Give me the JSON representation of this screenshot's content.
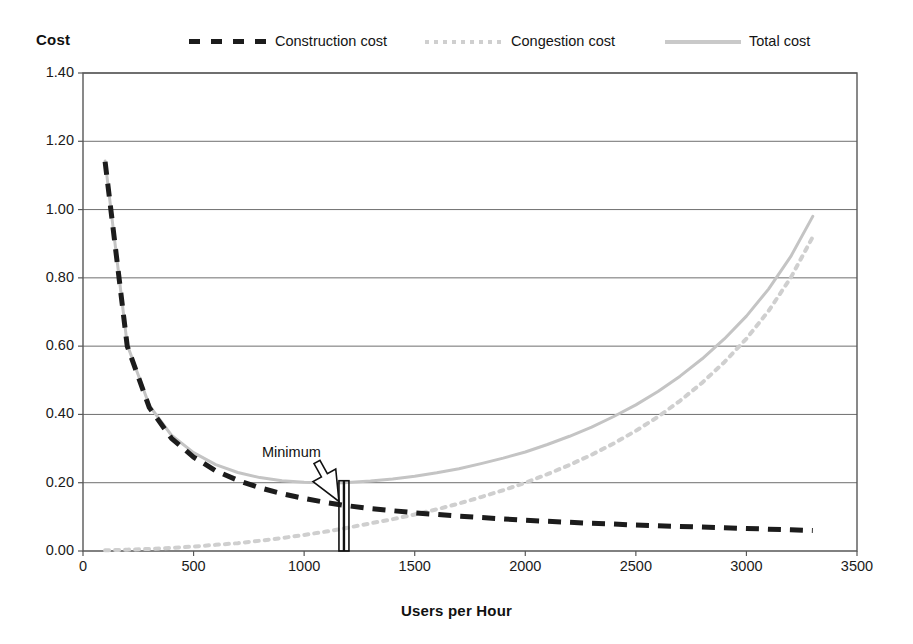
{
  "chart_data": {
    "type": "line",
    "title": "",
    "xlabel": "Users per Hour",
    "ylabel": "Cost",
    "xlim": [
      0,
      3500
    ],
    "ylim": [
      0.0,
      1.4
    ],
    "grid": "horizontal",
    "legend_position": "top",
    "x_ticks": [
      "0",
      "500",
      "1000",
      "1500",
      "2000",
      "2500",
      "3000",
      "3500"
    ],
    "x_tick_values": [
      0,
      500,
      1000,
      1500,
      2000,
      2500,
      3000,
      3500
    ],
    "y_ticks": [
      "0.00",
      "0.20",
      "0.40",
      "0.60",
      "0.80",
      "1.00",
      "1.20",
      "1.40"
    ],
    "y_tick_values": [
      0.0,
      0.2,
      0.4,
      0.6,
      0.8,
      1.0,
      1.2,
      1.4
    ],
    "x": [
      100,
      200,
      300,
      400,
      500,
      600,
      700,
      800,
      900,
      1000,
      1100,
      1180,
      1300,
      1400,
      1500,
      1600,
      1700,
      1800,
      1900,
      2000,
      2100,
      2200,
      2300,
      2400,
      2500,
      2600,
      2700,
      2800,
      2900,
      3000,
      3100,
      3200,
      3300
    ],
    "series": [
      {
        "name": "Construction cost",
        "style": "dashed",
        "color": "#1c1c1c",
        "values": [
          1.14,
          0.6,
          0.42,
          0.33,
          0.275,
          0.235,
          0.207,
          0.185,
          0.168,
          0.154,
          0.142,
          0.134,
          0.124,
          0.118,
          0.112,
          0.107,
          0.102,
          0.098,
          0.094,
          0.09,
          0.087,
          0.084,
          0.081,
          0.079,
          0.076,
          0.074,
          0.072,
          0.07,
          0.068,
          0.066,
          0.064,
          0.062,
          0.06
        ]
      },
      {
        "name": "Congestion cost",
        "style": "dotted",
        "color": "#cfcfcf",
        "values": [
          0.002,
          0.004,
          0.006,
          0.009,
          0.013,
          0.018,
          0.023,
          0.03,
          0.038,
          0.047,
          0.057,
          0.066,
          0.081,
          0.093,
          0.107,
          0.122,
          0.139,
          0.158,
          0.178,
          0.2,
          0.225,
          0.252,
          0.282,
          0.315,
          0.352,
          0.393,
          0.44,
          0.493,
          0.553,
          0.622,
          0.703,
          0.8,
          0.92
        ]
      },
      {
        "name": "Total cost",
        "style": "solid",
        "color": "#c4c4c4",
        "values": [
          1.142,
          0.604,
          0.426,
          0.339,
          0.288,
          0.253,
          0.23,
          0.215,
          0.206,
          0.201,
          0.199,
          0.2,
          0.205,
          0.211,
          0.219,
          0.229,
          0.241,
          0.256,
          0.272,
          0.29,
          0.312,
          0.336,
          0.363,
          0.394,
          0.428,
          0.467,
          0.512,
          0.563,
          0.621,
          0.688,
          0.767,
          0.862,
          0.98
        ]
      }
    ],
    "annotations": [
      {
        "name": "minimum",
        "label": "Minimum",
        "points_to_x": 1180,
        "points_to_y": 0.13,
        "arrow": "outlined-down-right",
        "marker": "vertical-line"
      }
    ]
  },
  "axes": {
    "y_title": "Cost",
    "x_title": "Users per Hour"
  },
  "legend": {
    "items": [
      {
        "label": "Construction cost",
        "swatch": "dashed-black-swatch"
      },
      {
        "label": "Congestion cost",
        "swatch": "dotted-gray-swatch"
      },
      {
        "label": "Total cost",
        "swatch": "solid-gray-swatch"
      }
    ]
  }
}
